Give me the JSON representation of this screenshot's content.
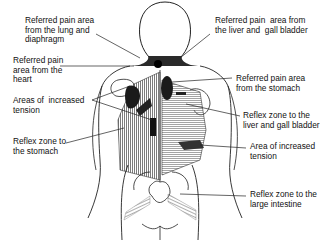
{
  "diagram": {
    "type": "anatomical-back-view",
    "labels": [
      {
        "id": "lung-diaphragm",
        "text": "Referred pain area\nfrom the lung and\ndiaphragm",
        "x": 25,
        "y": 16
      },
      {
        "id": "heart",
        "text": "Referred pain\narea from the\nheart",
        "x": 13,
        "y": 56
      },
      {
        "id": "tension-left",
        "text": "Areas of  increased\ntension",
        "x": 13,
        "y": 96
      },
      {
        "id": "stomach-reflex",
        "text": "Reflex zone to\nthe stomach",
        "x": 13,
        "y": 137
      },
      {
        "id": "liver-gallbladder",
        "text": "Referred pain  area from\nthe liver and  gall bladder",
        "x": 215,
        "y": 16
      },
      {
        "id": "stomach-pain",
        "text": "Referred pain area\nfrom the stomach",
        "x": 236,
        "y": 74
      },
      {
        "id": "liver-reflex",
        "text": "Reflex zone to the\nliver and gall bladder",
        "x": 243,
        "y": 111
      },
      {
        "id": "tension-right",
        "text": "Area of increased\ntension",
        "x": 250,
        "y": 142
      },
      {
        "id": "intestine-reflex",
        "text": "Reflex zone to the\nlarge intestine",
        "x": 250,
        "y": 190
      }
    ],
    "colors": {
      "outline": "#222222",
      "shade_dark": "#1a1a1a",
      "shade_mid": "#6a6a6a",
      "hatch": "#555555"
    }
  }
}
